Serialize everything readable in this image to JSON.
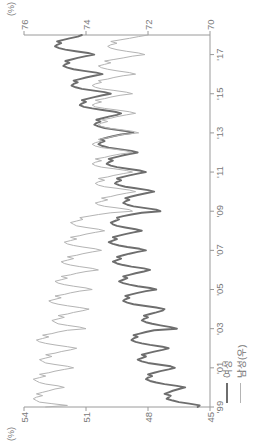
{
  "chart_data": {
    "type": "line",
    "title": "",
    "subtitle": "",
    "xlabel": "",
    "ylabel": "",
    "grid": false,
    "legend_position": "bottom-left",
    "orientation_note": "rendered rotated 90 degrees counter-clockwise",
    "axes": {
      "x": {
        "tick_labels": [
          "'99",
          "'01",
          "'03",
          "'05",
          "'07",
          "'09",
          "'11",
          "'13",
          "'15",
          "'17"
        ],
        "tick_values": [
          1999,
          2001,
          2003,
          2005,
          2007,
          2009,
          2011,
          2013,
          2015,
          2017
        ],
        "range": [
          1999,
          2018.0
        ]
      },
      "y_left": {
        "unit": "(%)",
        "tick_labels": [
          "45",
          "48",
          "51",
          "54"
        ],
        "tick_values": [
          45,
          48,
          51,
          54
        ],
        "range": [
          45,
          54
        ],
        "series": "여성"
      },
      "y_right": {
        "unit": "(%)",
        "tick_labels": [
          "70",
          "72",
          "74",
          "76"
        ],
        "tick_values": [
          70,
          72,
          74,
          76
        ],
        "range": [
          70,
          76
        ],
        "series": "남성(우)"
      }
    },
    "legend": [
      {
        "label": "여성",
        "color": "#6e6e6e",
        "axis": "left",
        "width": 1.9
      },
      {
        "label": "남성(우)",
        "color": "#b4b4b4",
        "axis": "right",
        "width": 1.0
      }
    ],
    "series": [
      {
        "name": "여성",
        "axis": "left",
        "color": "#6e6e6e",
        "x": [
          1999.0,
          1999.08,
          1999.17,
          1999.25,
          1999.33,
          1999.42,
          1999.5,
          1999.58,
          1999.67,
          1999.75,
          1999.83,
          1999.92,
          2000.0,
          2000.08,
          2000.17,
          2000.25,
          2000.33,
          2000.42,
          2000.5,
          2000.58,
          2000.67,
          2000.75,
          2000.83,
          2000.92,
          2001.0,
          2001.08,
          2001.17,
          2001.25,
          2001.33,
          2001.42,
          2001.5,
          2001.58,
          2001.67,
          2001.75,
          2001.83,
          2001.92,
          2002.0,
          2002.08,
          2002.17,
          2002.25,
          2002.33,
          2002.42,
          2002.5,
          2002.58,
          2002.67,
          2002.75,
          2002.83,
          2002.92,
          2003.0,
          2003.08,
          2003.17,
          2003.25,
          2003.33,
          2003.42,
          2003.5,
          2003.58,
          2003.67,
          2003.75,
          2003.83,
          2003.92,
          2004.0,
          2004.08,
          2004.17,
          2004.25,
          2004.33,
          2004.42,
          2004.5,
          2004.58,
          2004.67,
          2004.75,
          2004.83,
          2004.92,
          2005.0,
          2005.08,
          2005.17,
          2005.25,
          2005.33,
          2005.42,
          2005.5,
          2005.58,
          2005.67,
          2005.75,
          2005.83,
          2005.92,
          2006.0,
          2006.08,
          2006.17,
          2006.25,
          2006.33,
          2006.42,
          2006.5,
          2006.58,
          2006.67,
          2006.75,
          2006.83,
          2006.92,
          2007.0,
          2007.08,
          2007.17,
          2007.25,
          2007.33,
          2007.42,
          2007.5,
          2007.58,
          2007.67,
          2007.75,
          2007.83,
          2007.92,
          2008.0,
          2008.08,
          2008.17,
          2008.25,
          2008.33,
          2008.42,
          2008.5,
          2008.58,
          2008.67,
          2008.75,
          2008.83,
          2008.92,
          2009.0,
          2009.08,
          2009.17,
          2009.25,
          2009.33,
          2009.42,
          2009.5,
          2009.58,
          2009.67,
          2009.75,
          2009.83,
          2009.92,
          2010.0,
          2010.08,
          2010.17,
          2010.25,
          2010.33,
          2010.42,
          2010.5,
          2010.58,
          2010.67,
          2010.75,
          2010.83,
          2010.92,
          2011.0,
          2011.08,
          2011.17,
          2011.25,
          2011.33,
          2011.42,
          2011.5,
          2011.58,
          2011.67,
          2011.75,
          2011.83,
          2011.92,
          2012.0,
          2012.08,
          2012.17,
          2012.25,
          2012.33,
          2012.42,
          2012.5,
          2012.58,
          2012.67,
          2012.75,
          2012.83,
          2012.92,
          2013.0,
          2013.08,
          2013.17,
          2013.25,
          2013.33,
          2013.42,
          2013.5,
          2013.58,
          2013.67,
          2013.75,
          2013.83,
          2013.92,
          2014.0,
          2014.08,
          2014.17,
          2014.25,
          2014.33,
          2014.42,
          2014.5,
          2014.58,
          2014.67,
          2014.75,
          2014.83,
          2014.92,
          2015.0,
          2015.08,
          2015.17,
          2015.25,
          2015.33,
          2015.42,
          2015.5,
          2015.58,
          2015.67,
          2015.75,
          2015.83,
          2015.92,
          2016.0,
          2016.08,
          2016.17,
          2016.25,
          2016.33,
          2016.42,
          2016.5,
          2016.58,
          2016.67,
          2016.75,
          2016.83,
          2016.92,
          2017.0,
          2017.08,
          2017.17,
          2017.25,
          2017.33,
          2017.42,
          2017.5,
          2017.58,
          2017.67,
          2017.75,
          2017.83,
          2017.92,
          2018.0
        ],
        "values": [
          45.6,
          45.5,
          46.0,
          46.5,
          46.8,
          47.1,
          47.0,
          46.9,
          47.2,
          47.0,
          46.8,
          46.5,
          46.2,
          46.6,
          47.2,
          47.6,
          47.9,
          48.1,
          48.0,
          47.8,
          48.0,
          47.7,
          47.4,
          47.0,
          46.7,
          46.9,
          47.5,
          48.0,
          48.3,
          48.5,
          48.3,
          48.1,
          48.3,
          48.0,
          47.7,
          47.3,
          47.0,
          47.3,
          47.9,
          48.3,
          48.6,
          48.8,
          48.7,
          48.5,
          48.7,
          48.4,
          48.1,
          47.7,
          46.6,
          46.9,
          47.4,
          47.8,
          48.1,
          48.3,
          48.2,
          48.0,
          48.2,
          47.9,
          47.6,
          47.3,
          47.2,
          47.6,
          48.2,
          48.7,
          49.0,
          49.2,
          49.1,
          48.9,
          49.1,
          48.8,
          48.5,
          48.1,
          47.6,
          47.9,
          48.5,
          48.9,
          49.2,
          49.4,
          49.2,
          49.0,
          49.2,
          48.9,
          48.6,
          48.2,
          47.9,
          48.2,
          48.8,
          49.2,
          49.5,
          49.7,
          49.5,
          49.3,
          49.5,
          49.2,
          48.9,
          48.5,
          48.1,
          48.4,
          49.0,
          49.4,
          49.7,
          49.9,
          49.7,
          49.5,
          49.7,
          49.4,
          49.1,
          48.7,
          48.3,
          48.6,
          49.1,
          49.5,
          49.7,
          49.8,
          49.6,
          49.4,
          49.5,
          49.2,
          48.8,
          48.3,
          47.4,
          47.6,
          48.2,
          48.7,
          49.0,
          49.2,
          49.1,
          48.9,
          49.1,
          48.8,
          48.5,
          48.1,
          47.7,
          48.0,
          48.6,
          49.1,
          49.4,
          49.6,
          49.5,
          49.3,
          49.5,
          49.2,
          48.9,
          48.5,
          48.1,
          48.4,
          49.0,
          49.5,
          49.8,
          50.0,
          49.9,
          49.7,
          49.9,
          49.6,
          49.3,
          48.9,
          48.5,
          48.8,
          49.4,
          49.9,
          50.2,
          50.4,
          50.3,
          50.1,
          50.3,
          50.0,
          49.7,
          49.3,
          48.7,
          49.0,
          49.6,
          50.1,
          50.4,
          50.6,
          50.5,
          50.3,
          50.5,
          50.2,
          49.9,
          49.5,
          49.3,
          49.6,
          50.2,
          50.7,
          51.1,
          51.3,
          51.2,
          51.0,
          51.2,
          50.9,
          50.6,
          50.2,
          49.8,
          50.1,
          50.7,
          51.2,
          51.5,
          51.7,
          51.6,
          51.4,
          51.6,
          51.3,
          51.0,
          50.6,
          50.2,
          50.5,
          51.1,
          51.6,
          51.9,
          52.1,
          52.0,
          51.8,
          52.0,
          51.7,
          51.4,
          51.0,
          50.6,
          50.9,
          51.5,
          52.0,
          52.3,
          52.5,
          52.4,
          52.2,
          52.4,
          52.1,
          51.8,
          51.4,
          51.2
        ]
      },
      {
        "name": "남성(우)",
        "axis": "right",
        "color": "#b4b4b4",
        "x": [
          1999.0,
          1999.08,
          1999.17,
          1999.25,
          1999.33,
          1999.42,
          1999.5,
          1999.58,
          1999.67,
          1999.75,
          1999.83,
          1999.92,
          2000.0,
          2000.08,
          2000.17,
          2000.25,
          2000.33,
          2000.42,
          2000.5,
          2000.58,
          2000.67,
          2000.75,
          2000.83,
          2000.92,
          2001.0,
          2001.08,
          2001.17,
          2001.25,
          2001.33,
          2001.42,
          2001.5,
          2001.58,
          2001.67,
          2001.75,
          2001.83,
          2001.92,
          2002.0,
          2002.08,
          2002.17,
          2002.25,
          2002.33,
          2002.42,
          2002.5,
          2002.58,
          2002.67,
          2002.75,
          2002.83,
          2002.92,
          2003.0,
          2003.08,
          2003.17,
          2003.25,
          2003.33,
          2003.42,
          2003.5,
          2003.58,
          2003.67,
          2003.75,
          2003.83,
          2003.92,
          2004.0,
          2004.08,
          2004.17,
          2004.25,
          2004.33,
          2004.42,
          2004.5,
          2004.58,
          2004.67,
          2004.75,
          2004.83,
          2004.92,
          2005.0,
          2005.08,
          2005.17,
          2005.25,
          2005.33,
          2005.42,
          2005.5,
          2005.58,
          2005.67,
          2005.75,
          2005.83,
          2005.92,
          2006.0,
          2006.08,
          2006.17,
          2006.25,
          2006.33,
          2006.42,
          2006.5,
          2006.58,
          2006.67,
          2006.75,
          2006.83,
          2006.92,
          2007.0,
          2007.08,
          2007.17,
          2007.25,
          2007.33,
          2007.42,
          2007.5,
          2007.58,
          2007.67,
          2007.75,
          2007.83,
          2007.92,
          2008.0,
          2008.08,
          2008.17,
          2008.25,
          2008.33,
          2008.42,
          2008.5,
          2008.58,
          2008.67,
          2008.75,
          2008.83,
          2008.92,
          2009.0,
          2009.08,
          2009.17,
          2009.25,
          2009.33,
          2009.42,
          2009.5,
          2009.58,
          2009.67,
          2009.75,
          2009.83,
          2009.92,
          2010.0,
          2010.08,
          2010.17,
          2010.25,
          2010.33,
          2010.42,
          2010.5,
          2010.58,
          2010.67,
          2010.75,
          2010.83,
          2010.92,
          2011.0,
          2011.08,
          2011.17,
          2011.25,
          2011.33,
          2011.42,
          2011.5,
          2011.58,
          2011.67,
          2011.75,
          2011.83,
          2011.92,
          2012.0,
          2012.08,
          2012.17,
          2012.25,
          2012.33,
          2012.42,
          2012.5,
          2012.58,
          2012.67,
          2012.75,
          2012.83,
          2012.92,
          2013.0,
          2013.08,
          2013.17,
          2013.25,
          2013.33,
          2013.42,
          2013.5,
          2013.58,
          2013.67,
          2013.75,
          2013.83,
          2013.92,
          2014.0,
          2014.08,
          2014.17,
          2014.25,
          2014.33,
          2014.42,
          2014.5,
          2014.58,
          2014.67,
          2014.75,
          2014.83,
          2014.92,
          2015.0,
          2015.08,
          2015.17,
          2015.25,
          2015.33,
          2015.42,
          2015.5,
          2015.58,
          2015.67,
          2015.75,
          2015.83,
          2015.92,
          2016.0,
          2016.08,
          2016.17,
          2016.25,
          2016.33,
          2016.42,
          2016.5,
          2016.58,
          2016.67,
          2016.75,
          2016.83,
          2016.92,
          2017.0,
          2017.08,
          2017.17,
          2017.25,
          2017.33,
          2017.42,
          2017.5,
          2017.58,
          2017.67,
          2017.75,
          2017.83,
          2017.92,
          2018.0
        ],
        "values": [
          75.3,
          74.6,
          75.1,
          75.5,
          75.6,
          75.7,
          75.6,
          75.4,
          75.6,
          75.4,
          75.2,
          75.0,
          74.7,
          74.9,
          75.3,
          75.5,
          75.6,
          75.7,
          75.5,
          75.3,
          75.5,
          75.2,
          75.0,
          74.7,
          74.4,
          74.6,
          75.0,
          75.3,
          75.4,
          75.5,
          75.3,
          75.1,
          75.3,
          75.0,
          74.8,
          74.5,
          74.3,
          74.6,
          75.0,
          75.3,
          75.5,
          75.6,
          75.4,
          75.2,
          75.4,
          75.1,
          74.9,
          74.6,
          74.0,
          74.2,
          74.6,
          74.9,
          75.0,
          75.1,
          74.9,
          74.7,
          74.9,
          74.6,
          74.4,
          74.1,
          73.9,
          74.2,
          74.6,
          74.9,
          75.1,
          75.2,
          75.0,
          74.8,
          75.0,
          74.7,
          74.5,
          74.2,
          73.8,
          74.0,
          74.4,
          74.7,
          74.9,
          75.0,
          74.8,
          74.6,
          74.8,
          74.5,
          74.3,
          74.0,
          73.6,
          73.8,
          74.2,
          74.5,
          74.7,
          74.8,
          74.6,
          74.4,
          74.6,
          74.3,
          74.1,
          73.8,
          73.5,
          73.7,
          74.1,
          74.4,
          74.6,
          74.7,
          74.5,
          74.3,
          74.5,
          74.2,
          74.0,
          73.7,
          73.4,
          73.6,
          74.0,
          74.3,
          74.4,
          74.5,
          74.3,
          74.1,
          74.2,
          73.9,
          73.6,
          73.2,
          72.5,
          72.6,
          73.0,
          73.4,
          73.6,
          73.7,
          73.5,
          73.3,
          73.5,
          73.2,
          73.0,
          72.7,
          72.4,
          72.6,
          73.0,
          73.4,
          73.6,
          73.7,
          73.6,
          73.4,
          73.6,
          73.3,
          73.1,
          72.8,
          72.5,
          72.7,
          73.1,
          73.5,
          73.7,
          73.8,
          73.7,
          73.5,
          73.7,
          73.4,
          73.2,
          72.9,
          72.5,
          72.7,
          73.1,
          73.5,
          73.7,
          73.8,
          73.7,
          73.5,
          73.6,
          73.3,
          73.1,
          72.8,
          72.3,
          72.5,
          72.9,
          73.3,
          73.5,
          73.6,
          73.5,
          73.3,
          73.5,
          73.2,
          73.0,
          72.7,
          72.4,
          72.6,
          73.0,
          73.4,
          73.7,
          73.8,
          73.7,
          73.5,
          73.7,
          73.4,
          73.2,
          72.9,
          72.5,
          72.7,
          73.1,
          73.5,
          73.7,
          73.8,
          73.7,
          73.5,
          73.6,
          73.3,
          73.1,
          72.8,
          72.4,
          72.6,
          73.0,
          73.3,
          73.5,
          73.6,
          73.4,
          73.2,
          73.4,
          73.1,
          72.8,
          72.5,
          72.1,
          72.3,
          72.7,
          73.0,
          73.2,
          73.3,
          73.2,
          73.0,
          73.2,
          72.9,
          72.6,
          72.3,
          72.0
        ]
      }
    ]
  }
}
